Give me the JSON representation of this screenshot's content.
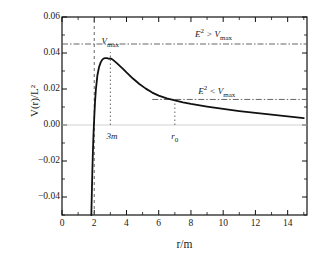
{
  "chart_data": {
    "type": "line",
    "title": "",
    "xlabel": "r/m",
    "ylabel": "V(r)/L²",
    "xlim": [
      0,
      15.2
    ],
    "ylim": [
      -0.05,
      0.06
    ],
    "grid": false,
    "legend_position": "none",
    "x_ticks": [
      "0",
      "2",
      "4",
      "6",
      "8",
      "10",
      "12",
      "14"
    ],
    "x_tick_values": [
      0,
      2,
      4,
      6,
      8,
      10,
      12,
      14
    ],
    "y_ticks": [
      "0.06",
      "0.04",
      "0.02",
      "0.00",
      "-0.02",
      "-0.04"
    ],
    "y_tick_values": [
      0.06,
      0.04,
      0.02,
      0.0,
      -0.02,
      -0.04
    ],
    "series": [
      {
        "name": "effective-potential",
        "style": "solid",
        "x": [
          1.82,
          1.85,
          1.88,
          1.92,
          1.96,
          2.0,
          2.05,
          2.1,
          2.2,
          2.3,
          2.4,
          2.5,
          2.6,
          2.7,
          2.8,
          2.9,
          3.0,
          3.1,
          3.2,
          3.4,
          3.6,
          3.8,
          4.0,
          4.4,
          4.8,
          5.2,
          5.6,
          6.0,
          6.5,
          7.0,
          7.5,
          8.0,
          9.0,
          10.0,
          11.0,
          12.0,
          13.0,
          14.0,
          15.0
        ],
        "y": [
          -0.05,
          -0.038,
          -0.027,
          -0.014,
          -0.004,
          0.004,
          0.013,
          0.0195,
          0.0278,
          0.0322,
          0.0348,
          0.0363,
          0.037,
          0.0372,
          0.0371,
          0.0368,
          0.037,
          0.0366,
          0.0359,
          0.0344,
          0.0327,
          0.031,
          0.0292,
          0.0258,
          0.0228,
          0.0202,
          0.018,
          0.0163,
          0.0148,
          0.0137,
          0.0126,
          0.0117,
          0.0102,
          0.0089,
          0.0077,
          0.0067,
          0.0058,
          0.0048,
          0.0038
        ]
      }
    ],
    "reference_lines": [
      {
        "name": "zero-line",
        "orientation": "horizontal",
        "value": 0.0,
        "style": "solid-light"
      },
      {
        "name": "horizon-line",
        "orientation": "vertical",
        "value": 2.0,
        "style": "dashed"
      },
      {
        "name": "e2-above-vmax-line",
        "orientation": "horizontal",
        "value": 0.045,
        "style": "dash-dot",
        "x_start": 0,
        "x_end": 15.2
      },
      {
        "name": "e2-below-vmax-line",
        "orientation": "horizontal",
        "value": 0.0142,
        "style": "dash-dot",
        "x_start": 5.6,
        "x_end": 15.2
      },
      {
        "name": "vmax-marker-line",
        "orientation": "vertical",
        "value": 3.0,
        "style": "dotted",
        "y_start": 0.0,
        "y_end": 0.0405
      },
      {
        "name": "r0-marker-line",
        "orientation": "vertical",
        "value": 7.0,
        "style": "dotted",
        "y_start": 0.0,
        "y_end": 0.0142
      }
    ],
    "annotations": [
      {
        "name": "vmax-label",
        "text_html": "V<sub>max</sub>",
        "text": "Vmax",
        "x": 3.0,
        "y": 0.0455
      },
      {
        "name": "e2-above-vmax-label",
        "text_html": "E<sup>2</sup> &gt; V<sub>max</sub>",
        "text": "E2 > Vmax",
        "x": 9.4,
        "y": 0.0508
      },
      {
        "name": "e2-below-vmax-label",
        "text_html": "E<sup>2</sup> &lt; V<sub>max</sub>",
        "text": "E2 < Vmax",
        "x": 9.6,
        "y": 0.019
      },
      {
        "name": "three-m-label",
        "text_html": "3m",
        "text": "3m",
        "x": 3.1,
        "y": -0.0072
      },
      {
        "name": "r0-label",
        "text_html": "r<sub>0</sub>",
        "text": "r0",
        "x": 7.0,
        "y": -0.0072
      }
    ],
    "colors": {
      "curve": "#111111",
      "axis": "#111111",
      "dashed": "#555555",
      "dashdot": "#555555",
      "zero": "#cccccc",
      "background": "#ffffff"
    }
  }
}
